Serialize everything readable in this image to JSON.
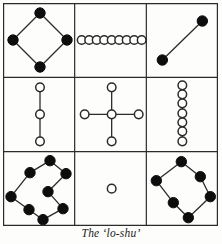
{
  "figure": {
    "caption": "The ‘lo-shu’",
    "title_text": "The 'lo-shu'",
    "grid": {
      "rows": 3,
      "cols": 3,
      "border_color": "#2b2b2b",
      "background": "#fdfdfb"
    },
    "dot_styles": {
      "filled": {
        "label": "filled-dot",
        "fill": "#0d0d0d",
        "stroke": "#0d0d0d"
      },
      "open": {
        "label": "open-circle",
        "fill": "#ffffff",
        "stroke": "#2b2b2b"
      }
    }
  },
  "chart_data": {
    "type": "diagram",
    "subtitle": "",
    "xlabel": "",
    "ylabel": "",
    "magic_constant": 15,
    "grid_values": [
      [
        4,
        9,
        2
      ],
      [
        3,
        5,
        7
      ],
      [
        8,
        1,
        6
      ]
    ],
    "cells": [
      {
        "index": 1,
        "row": 1,
        "col": 1,
        "value": 4,
        "parity": "even",
        "marker": "filled",
        "shape": "diamond",
        "count": 4,
        "name": "cell-4",
        "points": [
          [
            37,
            10
          ],
          [
            10,
            37
          ],
          [
            37,
            64
          ],
          [
            64,
            37
          ]
        ],
        "edges": [
          [
            0,
            1
          ],
          [
            1,
            2
          ],
          [
            2,
            3
          ],
          [
            3,
            0
          ]
        ]
      },
      {
        "index": 2,
        "row": 1,
        "col": 2,
        "value": 9,
        "parity": "odd",
        "marker": "open",
        "shape": "horizontal-row",
        "count": 9,
        "name": "cell-9",
        "points": [
          [
            7,
            37
          ],
          [
            14.5,
            37
          ],
          [
            22,
            37
          ],
          [
            29.5,
            37
          ],
          [
            37,
            37
          ],
          [
            44.5,
            37
          ],
          [
            52,
            37
          ],
          [
            59.5,
            37
          ],
          [
            67,
            37
          ]
        ],
        "edges": [
          [
            0,
            8
          ]
        ]
      },
      {
        "index": 3,
        "row": 1,
        "col": 3,
        "value": 2,
        "parity": "even",
        "marker": "filled",
        "shape": "diagonal-pair",
        "count": 2,
        "name": "cell-2",
        "points": [
          [
            16,
            57
          ],
          [
            56,
            18
          ]
        ],
        "edges": [
          [
            0,
            1
          ]
        ]
      },
      {
        "index": 4,
        "row": 2,
        "col": 1,
        "value": 3,
        "parity": "odd",
        "marker": "open",
        "shape": "vertical-line",
        "count": 3,
        "name": "cell-3",
        "points": [
          [
            37,
            10
          ],
          [
            37,
            37
          ],
          [
            37,
            64
          ]
        ],
        "edges": [
          [
            0,
            1
          ],
          [
            1,
            2
          ]
        ]
      },
      {
        "index": 5,
        "row": 2,
        "col": 2,
        "value": 5,
        "parity": "odd",
        "marker": "open",
        "shape": "cross",
        "count": 5,
        "name": "cell-5",
        "points": [
          [
            37,
            37
          ],
          [
            37,
            10
          ],
          [
            64,
            37
          ],
          [
            37,
            64
          ],
          [
            10,
            37
          ]
        ],
        "edges": [
          [
            0,
            1
          ],
          [
            0,
            2
          ],
          [
            0,
            3
          ],
          [
            0,
            4
          ]
        ]
      },
      {
        "index": 6,
        "row": 2,
        "col": 3,
        "value": 7,
        "parity": "odd",
        "marker": "open",
        "shape": "vertical-column",
        "count": 7,
        "name": "cell-7",
        "points": [
          [
            36,
            8
          ],
          [
            36,
            17
          ],
          [
            36,
            26
          ],
          [
            36,
            36
          ],
          [
            36,
            45
          ],
          [
            36,
            54
          ],
          [
            36,
            64
          ]
        ],
        "edges": [
          [
            0,
            6
          ]
        ]
      },
      {
        "index": 7,
        "row": 3,
        "col": 1,
        "value": 8,
        "parity": "even",
        "marker": "filled",
        "shape": "tilted-rectangle",
        "count": 8,
        "name": "cell-8",
        "points": [
          [
            47,
            9
          ],
          [
            27,
            21
          ],
          [
            63,
            22
          ],
          [
            8,
            45
          ],
          [
            45,
            40
          ],
          [
            26,
            58
          ],
          [
            60,
            57
          ],
          [
            40,
            68
          ]
        ],
        "edges": [
          [
            0,
            1
          ],
          [
            1,
            3
          ],
          [
            3,
            5
          ],
          [
            5,
            7
          ],
          [
            7,
            6
          ],
          [
            6,
            4
          ],
          [
            4,
            2
          ],
          [
            2,
            0
          ]
        ]
      },
      {
        "index": 8,
        "row": 3,
        "col": 2,
        "value": 1,
        "parity": "odd",
        "marker": "open",
        "shape": "single-dot",
        "count": 1,
        "name": "cell-1",
        "points": [
          [
            37,
            37
          ]
        ],
        "edges": []
      },
      {
        "index": 9,
        "row": 3,
        "col": 3,
        "value": 6,
        "parity": "even",
        "marker": "filled",
        "shape": "tilted-hexagon",
        "count": 6,
        "name": "cell-6",
        "points": [
          [
            35,
            10
          ],
          [
            10,
            29
          ],
          [
            54,
            25
          ],
          [
            27,
            51
          ],
          [
            64,
            45
          ],
          [
            42,
            66
          ]
        ],
        "edges": [
          [
            0,
            1
          ],
          [
            1,
            3
          ],
          [
            3,
            5
          ],
          [
            5,
            4
          ],
          [
            4,
            2
          ],
          [
            2,
            0
          ]
        ]
      }
    ]
  }
}
